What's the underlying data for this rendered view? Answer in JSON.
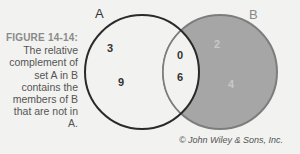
{
  "caption": {
    "label": "FIGURE 14-14:",
    "text": "The relative complement of set A in B contains the members of B that are not in A."
  },
  "diagram": {
    "set_a": {
      "label": "A",
      "only": [
        "3",
        "9"
      ]
    },
    "set_b": {
      "label": "B",
      "only": [
        "2",
        "4"
      ]
    },
    "intersection": [
      "0",
      "6"
    ],
    "colors": {
      "background": "#f2f2f0",
      "shaded_region": "#a6a6a6",
      "circle_a_stroke": "#2a2a2a",
      "circle_b_stroke": "#7d7d7d"
    }
  },
  "copyright": "© John Wiley & Sons, Inc."
}
